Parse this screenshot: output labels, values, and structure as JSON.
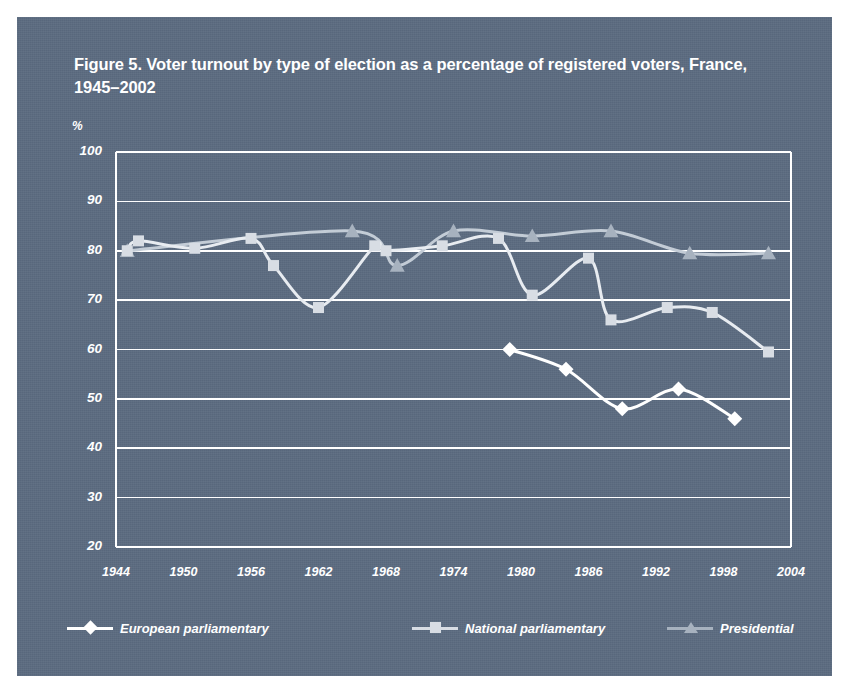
{
  "figure": {
    "title": "Figure 5. Voter turnout by type of election as a percentage of registered voters, France, 1945–2002",
    "panel_color": "#5b6b80",
    "page_color": "#ffffff"
  },
  "chart_data": {
    "type": "line",
    "title": "Figure 5. Voter turnout by type of election as a percentage of registered voters, France, 1945–2002",
    "xlabel": "",
    "ylabel": "%",
    "unit_label": "%",
    "xlim": [
      1944,
      2004
    ],
    "ylim": [
      20,
      100
    ],
    "y_ticks": [
      100,
      90,
      80,
      70,
      60,
      50,
      40,
      30,
      20
    ],
    "x_ticks": [
      1944,
      1950,
      1956,
      1962,
      1968,
      1974,
      1980,
      1986,
      1992,
      1998,
      2004
    ],
    "grid": true,
    "grid_color": "#ffffff",
    "legend_position": "bottom",
    "series": [
      {
        "name": "European parliamentary",
        "marker": "diamond",
        "color": "#ffffff",
        "line_color": "#ffffff",
        "points": [
          {
            "x": 1979,
            "y": 60.0
          },
          {
            "x": 1984,
            "y": 56.0
          },
          {
            "x": 1989,
            "y": 48.0
          },
          {
            "x": 1994,
            "y": 52.0
          },
          {
            "x": 1999,
            "y": 46.0
          }
        ]
      },
      {
        "name": "National parliamentary",
        "marker": "square",
        "color": "#d8dde4",
        "line_color": "#e8ecf1",
        "points": [
          {
            "x": 1945,
            "y": 80.0
          },
          {
            "x": 1946,
            "y": 82.0
          },
          {
            "x": 1951,
            "y": 80.5
          },
          {
            "x": 1956,
            "y": 82.5
          },
          {
            "x": 1958,
            "y": 77.0
          },
          {
            "x": 1962,
            "y": 68.5
          },
          {
            "x": 1967,
            "y": 81.0
          },
          {
            "x": 1968,
            "y": 80.0
          },
          {
            "x": 1973,
            "y": 81.0
          },
          {
            "x": 1978,
            "y": 82.5
          },
          {
            "x": 1981,
            "y": 71.0
          },
          {
            "x": 1986,
            "y": 78.5
          },
          {
            "x": 1988,
            "y": 66.0
          },
          {
            "x": 1993,
            "y": 68.5
          },
          {
            "x": 1997,
            "y": 67.5
          },
          {
            "x": 2002,
            "y": 59.5
          }
        ]
      },
      {
        "name": "Presidential",
        "marker": "triangle",
        "color": "#a7b2bf",
        "line_color": "#c3ccd6",
        "points": [
          {
            "x": 1945,
            "y": 80.0
          },
          {
            "x": 1965,
            "y": 84.0
          },
          {
            "x": 1969,
            "y": 77.0
          },
          {
            "x": 1974,
            "y": 84.0
          },
          {
            "x": 1981,
            "y": 83.0
          },
          {
            "x": 1988,
            "y": 84.0
          },
          {
            "x": 1995,
            "y": 79.5
          },
          {
            "x": 2002,
            "y": 79.5
          }
        ]
      }
    ]
  },
  "legend": {
    "items": [
      {
        "label": "European parliamentary",
        "marker": "diamond",
        "color": "#ffffff"
      },
      {
        "label": "National parliamentary",
        "marker": "square",
        "color": "#d8dde4"
      },
      {
        "label": "Presidential",
        "marker": "triangle",
        "color": "#a7b2bf"
      }
    ]
  }
}
